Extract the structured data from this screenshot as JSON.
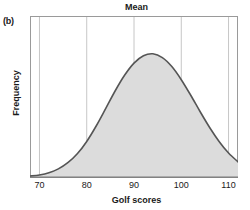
{
  "panel": {
    "label": "(b)"
  },
  "chart_data": {
    "type": "area",
    "title": "Mean",
    "xlabel": "Golf scores",
    "ylabel": "Frequency",
    "tick_labels": [
      "70",
      "80",
      "90",
      "100",
      "110"
    ],
    "x": [
      70,
      80,
      90,
      100,
      110
    ],
    "xlim": [
      68,
      112
    ],
    "ylim": [
      0,
      1
    ],
    "grid": true,
    "legend": "none",
    "distribution": {
      "shape": "normal",
      "mean": 90,
      "std": 8
    },
    "curve": {
      "x": [
        68,
        70,
        72,
        74,
        76,
        78,
        80,
        82,
        84,
        86,
        88,
        90,
        92,
        94,
        96,
        98,
        100,
        102,
        104,
        106,
        108,
        110,
        112
      ],
      "y": [
        0.006,
        0.014,
        0.029,
        0.055,
        0.097,
        0.158,
        0.242,
        0.347,
        0.465,
        0.585,
        0.692,
        0.775,
        0.825,
        0.838,
        0.812,
        0.751,
        0.662,
        0.556,
        0.444,
        0.337,
        0.242,
        0.163,
        0.103
      ]
    },
    "colors": {
      "curve": "#555555",
      "fill": "#dcdcdc",
      "grid": "#bfbfbf",
      "axis": "#999999",
      "text": "#1a1a1a"
    }
  }
}
